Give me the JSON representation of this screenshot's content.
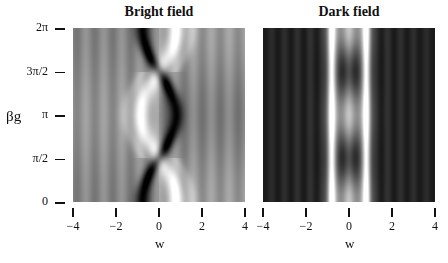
{
  "chart_data": [
    {
      "type": "heatmap",
      "title": "Bright field",
      "xlabel": "w",
      "ylabel": "βg",
      "xlim": [
        -4,
        4
      ],
      "ylim": [
        0,
        6.2832
      ],
      "xticks": [
        "−4",
        "−2",
        "0",
        "2",
        "4"
      ],
      "xtick_values": [
        -4,
        -2,
        0,
        2,
        4
      ],
      "yticks": [
        "0",
        "π/2",
        "π",
        "3π/2",
        "2π"
      ],
      "ytick_values": [
        0,
        1.5708,
        3.1416,
        4.7124,
        6.2832
      ],
      "colormap": "grayscale",
      "description": "Grey background with fringes; dark band near w≈-0.8 at β=0,2π shifting to w≈+0.8 at β=π; bright band mirrors it"
    },
    {
      "type": "heatmap",
      "title": "Dark field",
      "xlabel": "w",
      "ylabel": "",
      "xlim": [
        -4,
        4
      ],
      "ylim": [
        0,
        6.2832
      ],
      "xticks": [
        "−4",
        "−2",
        "0",
        "2",
        "4"
      ],
      "xtick_values": [
        -4,
        -2,
        0,
        2,
        4
      ],
      "yticks": [],
      "colormap": "grayscale",
      "description": "Dark background with symmetric vertical fringes; bright bands at w≈±0.8; dark spots at w=0, β≈π/2 and 3π/2"
    }
  ]
}
